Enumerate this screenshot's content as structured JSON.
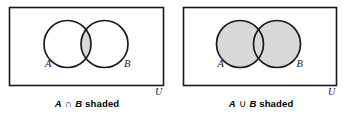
{
  "figure": {
    "type": "venn-diagram-pair",
    "background_color": "#ffffff",
    "line_color": "#1a1a1a",
    "shade_color": "#d8d8d8",
    "panels": [
      {
        "id": "intersection",
        "universe_label": "U",
        "set_a_label": "A",
        "set_b_label": "B",
        "caption_set_a": "A",
        "caption_operator": "∩",
        "caption_set_b": "B",
        "caption_suffix": "shaded",
        "shaded_region": "intersection"
      },
      {
        "id": "union",
        "universe_label": "U",
        "set_a_label": "A",
        "set_b_label": "B",
        "caption_set_a": "A",
        "caption_operator": "∪",
        "caption_set_b": "B",
        "caption_suffix": "shaded",
        "shaded_region": "union"
      }
    ]
  }
}
